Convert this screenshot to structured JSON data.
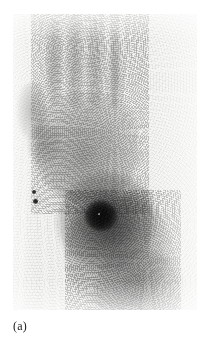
{
  "figure": {
    "caption": "(a)",
    "modality_label": "scintigram",
    "background_color": "#ffffff",
    "panel_color": "#f4f4f2",
    "ink_color": "#1b1b1b"
  },
  "panel": {
    "x": 13,
    "y": 14,
    "width": 184,
    "height": 296,
    "border": "none"
  },
  "scan": {
    "type": "planar-bone-scintigraphy",
    "body_part": "hand-and-wrist",
    "view": "dorsal-palmar",
    "colormap": "grayscale-inverted",
    "regions": [
      {
        "name": "finger-1",
        "label": "index-finger",
        "x": 46,
        "y": 18,
        "w": 17,
        "h": 86,
        "intensity": 0.3
      },
      {
        "name": "finger-2",
        "label": "middle-finger",
        "x": 66,
        "y": 12,
        "w": 18,
        "h": 96,
        "intensity": 0.34
      },
      {
        "name": "finger-3",
        "label": "ring-finger",
        "x": 86,
        "y": 17,
        "w": 18,
        "h": 92,
        "intensity": 0.32
      },
      {
        "name": "finger-4",
        "label": "little-finger",
        "x": 107,
        "y": 30,
        "w": 16,
        "h": 78,
        "intensity": 0.26
      },
      {
        "name": "thumb",
        "label": "thumb",
        "x": 17,
        "y": 82,
        "w": 30,
        "h": 58,
        "intensity": 0.34
      },
      {
        "name": "palm",
        "label": "metacarpals-palm",
        "x": 34,
        "y": 92,
        "w": 104,
        "h": 110,
        "intensity": 0.4
      },
      {
        "name": "forearm",
        "label": "distal-forearm",
        "x": 66,
        "y": 196,
        "w": 104,
        "h": 110,
        "intensity": 0.38
      }
    ],
    "hotspot": {
      "name": "focal-uptake",
      "label": "intense-focal-uptake-wrist",
      "center_x": 100,
      "center_y": 228,
      "core_radius": 13,
      "halo_radius": 42,
      "intensity": 1.0
    },
    "markers": [
      {
        "name": "marker-dot-upper",
        "x": 34,
        "y": 192,
        "r": 2.2
      },
      {
        "name": "marker-dot-lower",
        "x": 35,
        "y": 201,
        "r": 2.4
      }
    ]
  }
}
